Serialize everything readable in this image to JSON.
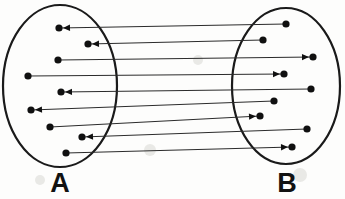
{
  "figure": {
    "type": "set-mapping-diagram",
    "background_color": "#fdfdfc",
    "ink_color": "#101010",
    "line_color": "#2b2b2b"
  },
  "sets": {
    "left": {
      "label": "A",
      "label_x": 60,
      "label_y": 192,
      "cx": 60,
      "cy": 86,
      "rx": 57,
      "ry": 81
    },
    "right": {
      "label": "B",
      "label_x": 287,
      "label_y": 192,
      "cx": 286,
      "cy": 86,
      "rx": 54,
      "ry": 78
    }
  },
  "mappings": [
    {
      "id": "m1",
      "from_x": 59,
      "from_y": 28,
      "to_x": 286,
      "to_y": 24,
      "arrow_dir": "left"
    },
    {
      "id": "m2",
      "from_x": 88,
      "from_y": 44,
      "to_x": 263,
      "to_y": 40,
      "arrow_dir": "left"
    },
    {
      "id": "m3",
      "from_x": 58,
      "from_y": 60,
      "to_x": 313,
      "to_y": 57,
      "arrow_dir": "right"
    },
    {
      "id": "m4",
      "from_x": 28,
      "from_y": 76,
      "to_x": 284,
      "to_y": 74,
      "arrow_dir": "right"
    },
    {
      "id": "m5",
      "from_x": 61,
      "from_y": 92,
      "to_x": 311,
      "to_y": 89,
      "arrow_dir": "left"
    },
    {
      "id": "m6",
      "from_x": 31,
      "from_y": 110,
      "to_x": 274,
      "to_y": 101,
      "arrow_dir": "left"
    },
    {
      "id": "m7",
      "from_x": 50,
      "from_y": 127,
      "to_x": 260,
      "to_y": 116,
      "arrow_dir": "right"
    },
    {
      "id": "m8",
      "from_x": 82,
      "from_y": 137,
      "to_x": 307,
      "to_y": 129,
      "arrow_dir": "left"
    },
    {
      "id": "m9",
      "from_x": 66,
      "from_y": 153,
      "to_x": 292,
      "to_y": 147,
      "arrow_dir": "right"
    }
  ],
  "counts": {
    "left_nodes": 9,
    "right_nodes": 9,
    "arrows": 9
  }
}
